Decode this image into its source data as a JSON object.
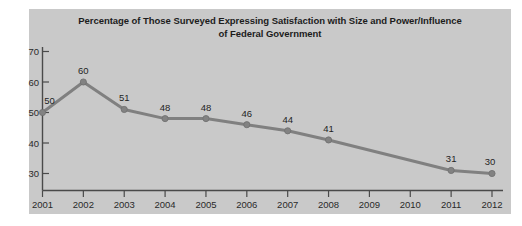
{
  "chart_data": {
    "type": "line",
    "title": "Percentage of Those Surveyed Expressing Satisfaction with Size and Power/Influence\nof Federal Government",
    "title_line1": "Percentage of Those Surveyed Expressing Satisfaction with Size and Power/Influence",
    "title_line2": "of Federal Government",
    "xlabel": "",
    "ylabel": "",
    "categories": [
      "2001",
      "2002",
      "2003",
      "2004",
      "2005",
      "2006",
      "2007",
      "2008",
      "2009",
      "2010",
      "2011",
      "2012"
    ],
    "values": [
      50,
      60,
      51,
      48,
      48,
      46,
      44,
      41,
      null,
      null,
      31,
      30
    ],
    "point_labels": [
      "50",
      "60",
      "51",
      "48",
      "48",
      "46",
      "44",
      "41",
      "",
      "",
      "31",
      "30"
    ],
    "markers_shown": [
      true,
      true,
      true,
      true,
      true,
      true,
      true,
      true,
      false,
      false,
      true,
      true
    ],
    "ylim": [
      25,
      70
    ],
    "y_ticks": [
      30,
      40,
      50,
      60,
      70
    ],
    "y_tick_labels": [
      "30",
      "40",
      "50",
      "60",
      "70"
    ],
    "x_tick_labels": [
      "2001",
      "2002",
      "2003",
      "2004",
      "2005",
      "2006",
      "2007",
      "2008",
      "2009",
      "2010",
      "2011",
      "2012"
    ],
    "grid": false,
    "legend": null,
    "series_color": "#808080",
    "panel_color": "#c9c9c9",
    "axis_color": "#4a4a4a",
    "text_color": "#1c1c1c"
  }
}
